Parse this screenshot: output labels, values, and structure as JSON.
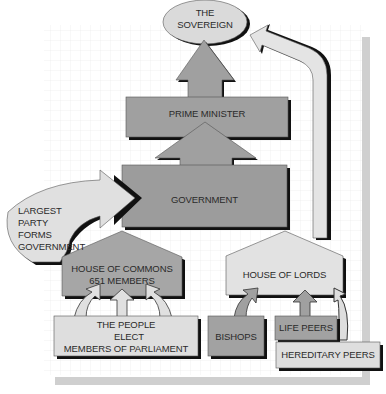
{
  "diagram": {
    "type": "flowchart",
    "nodes": {
      "sovereign": {
        "line1": "THE",
        "line2": "SOVEREIGN"
      },
      "prime_minister": {
        "label": "PRIME MINISTER"
      },
      "government": {
        "label": "GOVERNMENT"
      },
      "largest_party": {
        "line1": "LARGEST",
        "line2": "PARTY",
        "line3": "FORMS",
        "line4": "GOVERNMENT"
      },
      "house_of_commons": {
        "line1": "HOUSE OF COMMONS",
        "line2": "651 MEMBERS"
      },
      "the_people": {
        "line1": "THE PEOPLE",
        "line2": "ELECT",
        "line3": "MEMBERS OF PARLIAMENT"
      },
      "house_of_lords": {
        "label": "HOUSE OF LORDS"
      },
      "bishops": {
        "label": "BISHOPS"
      },
      "life_peers": {
        "label": "LIFE PEERS"
      },
      "hereditary_peers": {
        "label": "HEREDITARY PEERS"
      }
    },
    "edges": [
      {
        "from": "the_people",
        "to": "house_of_commons"
      },
      {
        "from": "house_of_commons",
        "to": "government",
        "via": "largest_party"
      },
      {
        "from": "government",
        "to": "prime_minister"
      },
      {
        "from": "prime_minister",
        "to": "sovereign"
      },
      {
        "from": "bishops",
        "to": "house_of_lords"
      },
      {
        "from": "life_peers",
        "to": "house_of_lords"
      },
      {
        "from": "hereditary_peers",
        "to": "house_of_lords"
      },
      {
        "from": "house_of_lords",
        "to": "sovereign"
      }
    ],
    "colors": {
      "dark_fill": "#9a9a9a",
      "light_fill": "#dcdcdc",
      "shadow": "#111111",
      "grid": "#e6e6e6",
      "frame": "#cfcfcf"
    }
  }
}
